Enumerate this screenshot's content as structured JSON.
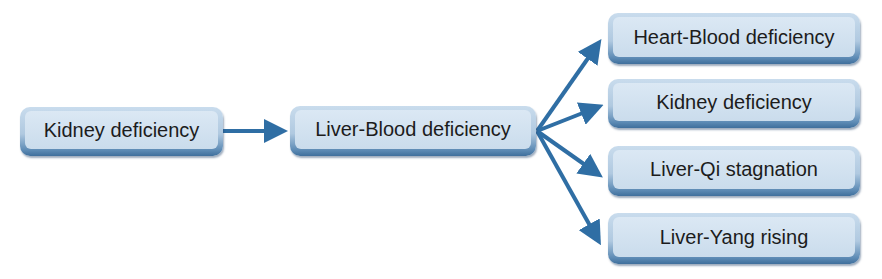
{
  "diagram": {
    "type": "flowchart",
    "arrow_color": "#2f6ea4",
    "nodes": {
      "root": {
        "label": "Kidney deficiency"
      },
      "middle": {
        "label": "Liver-Blood deficiency"
      },
      "outcomes": [
        {
          "label": "Heart-Blood deficiency"
        },
        {
          "label": "Kidney deficiency"
        },
        {
          "label": "Liver-Qi stagnation"
        },
        {
          "label": "Liver-Yang rising"
        }
      ]
    },
    "edges": [
      {
        "from": "Kidney deficiency",
        "to": "Liver-Blood deficiency"
      },
      {
        "from": "Liver-Blood deficiency",
        "to": "Heart-Blood deficiency"
      },
      {
        "from": "Liver-Blood deficiency",
        "to": "Kidney deficiency"
      },
      {
        "from": "Liver-Blood deficiency",
        "to": "Liver-Qi stagnation"
      },
      {
        "from": "Liver-Blood deficiency",
        "to": "Liver-Yang rising"
      }
    ]
  }
}
